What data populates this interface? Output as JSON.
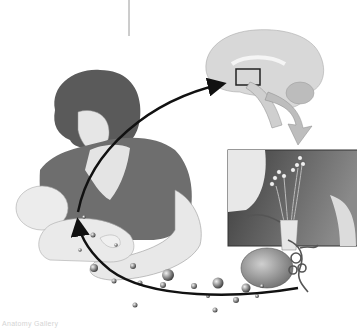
{
  "figure": {
    "style": "grayscale",
    "panels": [
      {
        "id": "mother-infant",
        "description": "mother nursing infant"
      },
      {
        "id": "brain",
        "description": "sagittal brain section with hypothalamus region boxed"
      },
      {
        "id": "pituitary-inset",
        "description": "enlarged inset of hypothalamus and pituitary gland"
      }
    ],
    "arrows": [
      {
        "id": "nerve-signal-arrow",
        "from": "breast",
        "to": "brain"
      },
      {
        "id": "hormone-arrow",
        "from": "pituitary",
        "to": "breast"
      },
      {
        "id": "zoom-arrow",
        "from": "brain-box",
        "to": "pituitary-inset"
      }
    ],
    "caption": "Anatomy Gallery"
  },
  "colors": {
    "background": "#ffffff",
    "ink": "#111111",
    "hair": "#5a5a5a",
    "dress": "#6e6e6e",
    "skin": "#e4e4e4",
    "brain": "#d8d8d8",
    "inset_dark": "#4a4a4a",
    "zoom_arrow": "#bdbdbd"
  }
}
